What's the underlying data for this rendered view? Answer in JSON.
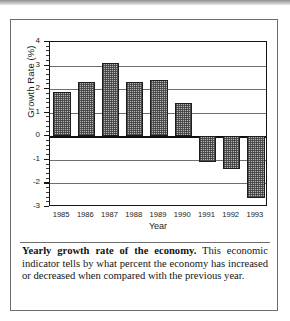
{
  "figure": {
    "caption_lead": "Yearly growth rate of the economy.",
    "caption_body": " This economic indicator tells by what percent the economy has increased or decreased when compared with the previous year."
  },
  "chart_data": {
    "type": "bar",
    "title": "",
    "xlabel": "Year",
    "ylabel": "Growth Rate (%)",
    "categories": [
      "1985",
      "1986",
      "1987",
      "1988",
      "1989",
      "1990",
      "1991",
      "1992",
      "1993"
    ],
    "values": [
      1.9,
      2.3,
      3.1,
      2.3,
      2.4,
      1.4,
      -1.1,
      -1.4,
      -2.6
    ],
    "ylim": [
      -3,
      4
    ],
    "ytick_labels": [
      "4",
      "3",
      "2",
      "1",
      "0",
      "-1",
      "-2",
      "-3"
    ],
    "ytick_values": [
      4,
      3,
      2,
      1,
      0,
      -1,
      -2,
      -3
    ],
    "yminor_step": 0.2,
    "grid": "horizontal",
    "legend": "none",
    "bar_fill": "#b4b4b4",
    "bar_edge": "#1d1d1d",
    "axis_color": "#141414",
    "grid_color": "#6f6f6f",
    "background": "#ffffff"
  }
}
